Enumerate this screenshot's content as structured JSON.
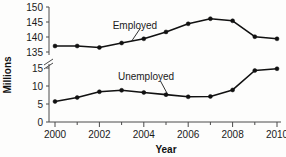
{
  "chart_data": {
    "type": "line",
    "title": "",
    "xlabel": "Year",
    "ylabel": "Millions",
    "x": [
      2000,
      2001,
      2002,
      2003,
      2004,
      2005,
      2006,
      2007,
      2008,
      2009,
      2010
    ],
    "xtick_labels": [
      "2000",
      "2002",
      "2004",
      "2006",
      "2008",
      "2010"
    ],
    "xtick_values": [
      2000,
      2002,
      2004,
      2006,
      2008,
      2010
    ],
    "xminor_values": [
      2001,
      2003,
      2005,
      2007,
      2009
    ],
    "xlim": [
      2000,
      2010
    ],
    "axis_break": true,
    "ytick_labels_lower": [
      "0",
      "5",
      "10",
      "15"
    ],
    "ytick_values_lower": [
      0,
      5,
      10,
      15
    ],
    "ytick_labels_upper": [
      "135",
      "140",
      "145",
      "150"
    ],
    "ytick_values_upper": [
      135,
      140,
      145,
      150
    ],
    "grid": false,
    "legend_position": "inline-annotation",
    "series": [
      {
        "name": "Employed",
        "label_text": "Employed",
        "values": [
          137.0,
          137.0,
          136.5,
          138.0,
          139.4,
          141.7,
          144.4,
          146.1,
          145.4,
          140.1,
          139.4
        ]
      },
      {
        "name": "Unemployed",
        "label_text": "Unemployed",
        "values": [
          5.7,
          6.8,
          8.4,
          8.8,
          8.2,
          7.6,
          7.0,
          7.1,
          8.9,
          14.3,
          14.8
        ]
      }
    ],
    "annotations": [
      {
        "text": "Employed",
        "x": 2003.6,
        "y": 143.6
      },
      {
        "text": "Unemployed",
        "x": 2004.1,
        "y": 12.4
      }
    ],
    "colors": {
      "line": "#111111",
      "marker": "#111111",
      "axis": "#4a4a4a",
      "text": "#1a1a1a",
      "background": "#fdfdfc"
    }
  }
}
